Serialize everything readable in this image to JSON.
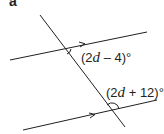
{
  "part_label": "a",
  "diagram": {
    "type": "parallel-lines-with-transversal",
    "lines": {
      "transversal": {
        "x1": 40,
        "y1": 15,
        "x2": 125,
        "y2": 127
      },
      "upper_parallel": {
        "x1": 10,
        "y1": 60,
        "x2": 147,
        "y2": 32
      },
      "lower_parallel": {
        "x1": 23,
        "y1": 130,
        "x2": 157,
        "y2": 100
      }
    },
    "stroke_color": "#231f20"
  },
  "angles": {
    "top": {
      "open": "(2",
      "var": "d",
      "rest": " – 4)°"
    },
    "bottom": {
      "open": "(2",
      "var": "d",
      "rest": " + 12)°"
    }
  }
}
